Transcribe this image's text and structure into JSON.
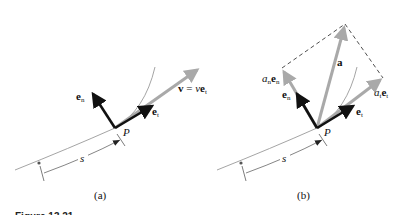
{
  "figure": {
    "caption": "Figure 13.21",
    "panels": [
      {
        "id": "a",
        "label": "(a)",
        "point_label": "P",
        "arc_label": "s",
        "vectors": [
          {
            "name": "e_n",
            "base": "e",
            "sub": "n",
            "color": "#111111",
            "kind": "unit-normal"
          },
          {
            "name": "e_t",
            "base": "e",
            "sub": "t",
            "color": "#111111",
            "kind": "unit-tangent"
          },
          {
            "name": "v",
            "text_lhs": "v",
            "text_eq": " = ",
            "text_scalar": "v",
            "text_vec": "e",
            "text_sub": "t",
            "color": "#a9a9a9",
            "kind": "velocity"
          }
        ]
      },
      {
        "id": "b",
        "label": "(b)",
        "point_label": "P",
        "arc_label": "s",
        "vectors": [
          {
            "name": "e_n",
            "base": "e",
            "sub": "n",
            "color": "#111111",
            "kind": "unit-normal"
          },
          {
            "name": "e_t",
            "base": "e",
            "sub": "t",
            "color": "#111111",
            "kind": "unit-tangent"
          },
          {
            "name": "a",
            "base": "a",
            "color": "#a9a9a9",
            "kind": "acceleration"
          },
          {
            "name": "a_n e_n",
            "scalar": "a",
            "scalar_sub": "n",
            "vec": "e",
            "vec_sub": "n",
            "color": "#a9a9a9",
            "kind": "normal-component"
          },
          {
            "name": "a_t e_t",
            "scalar": "a",
            "scalar_sub": "t",
            "vec": "e",
            "vec_sub": "t",
            "color": "#a9a9a9",
            "kind": "tangential-component"
          }
        ]
      }
    ],
    "colors": {
      "unit_vectors": "#111111",
      "component_vectors": "#a9a9a9",
      "curve": "#9a9a9a",
      "dashed": "#222222"
    }
  }
}
